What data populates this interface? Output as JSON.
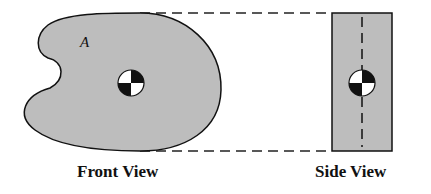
{
  "diagram": {
    "area_label": "A",
    "front_view_label": "Front View",
    "side_view_label": "Side View",
    "colors": {
      "fill": "#bdbdbd",
      "stroke": "#111111",
      "background": "#ffffff"
    },
    "centroid_symbol": "centroid-quartered-circle"
  }
}
